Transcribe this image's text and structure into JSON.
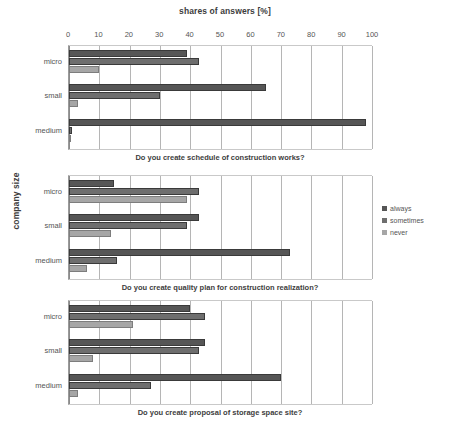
{
  "chart_data": {
    "type": "bar",
    "orientation": "horizontal",
    "title": "shares of answers [%]",
    "xlabel": "shares of answers [%]",
    "ylabel": "company size",
    "xlim": [
      0,
      100
    ],
    "xticks": [
      0,
      10,
      20,
      30,
      40,
      50,
      60,
      70,
      80,
      90,
      100
    ],
    "grid": true,
    "legend_position": "right",
    "legend": [
      "always",
      "sometimes",
      "never"
    ],
    "categories": [
      "micro",
      "small",
      "medium"
    ],
    "series_colors": {
      "always": "#565656",
      "sometimes": "#6e6e6e",
      "never": "#a6a6a6"
    },
    "panels": [
      {
        "caption": "Do you create schedule of  construction works?",
        "categories": [
          "micro",
          "small",
          "medium"
        ],
        "series": [
          {
            "name": "always",
            "values": [
              39,
              65,
              98
            ]
          },
          {
            "name": "sometimes",
            "values": [
              43,
              30,
              1
            ]
          },
          {
            "name": "never",
            "values": [
              10,
              3,
              0
            ]
          }
        ]
      },
      {
        "caption": "Do you create quality plan  for construction realization?",
        "categories": [
          "micro",
          "small",
          "medium"
        ],
        "series": [
          {
            "name": "always",
            "values": [
              15,
              43,
              73
            ]
          },
          {
            "name": "sometimes",
            "values": [
              43,
              39,
              16
            ]
          },
          {
            "name": "never",
            "values": [
              39,
              14,
              6
            ]
          }
        ]
      },
      {
        "caption": "Do you create proposal of  storage space site?",
        "categories": [
          "micro",
          "small",
          "medium"
        ],
        "series": [
          {
            "name": "always",
            "values": [
              40,
              45,
              70
            ]
          },
          {
            "name": "sometimes",
            "values": [
              45,
              43,
              27
            ]
          },
          {
            "name": "never",
            "values": [
              21,
              8,
              3
            ]
          }
        ]
      }
    ]
  }
}
